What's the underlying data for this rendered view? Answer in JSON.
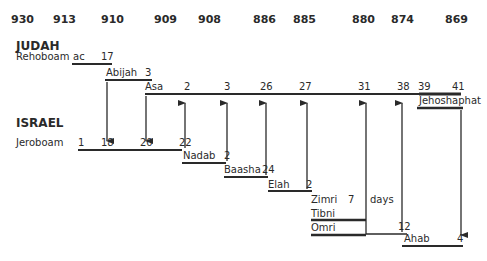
{
  "years": [
    "930",
    "913",
    "910",
    "909",
    "908",
    "886",
    "885",
    "880",
    "874",
    "869"
  ],
  "kingdoms": {
    "judah": "JUDAH",
    "israel": "ISRAEL"
  },
  "judah_kings": {
    "rehoboam": {
      "name": "Rehoboam",
      "start": "ac",
      "end": "17"
    },
    "abijah": {
      "name": "Abijah",
      "end": "3"
    },
    "asa": {
      "name": "Asa",
      "ticks": [
        "2",
        "3",
        "26",
        "27",
        "31",
        "38"
      ]
    },
    "jehoshaphat": {
      "name": "Jehoshaphat",
      "start": "39",
      "end": "41"
    }
  },
  "israel_kings": {
    "jeroboam": {
      "name": "Jeroboam",
      "ticks": [
        "1",
        "18",
        "20",
        "22"
      ]
    },
    "nadab": {
      "name": "Nadab",
      "end": "2"
    },
    "baasha": {
      "name": "Baasha",
      "end": "24"
    },
    "elah": {
      "name": "Elah",
      "end": "2"
    },
    "zimri": {
      "name": "Zimri",
      "end": "7",
      "unit": "days"
    },
    "tibni": {
      "name": "Tibni"
    },
    "omri": {
      "name": "Omri",
      "end": "12"
    },
    "ahab": {
      "name": "Ahab",
      "end": "4"
    }
  }
}
